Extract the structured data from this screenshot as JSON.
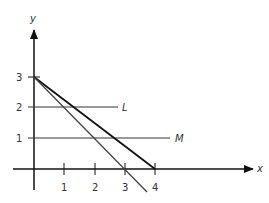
{
  "diagram": {
    "axes": {
      "x_label": "x",
      "y_label": "y",
      "x_ticks": [
        "1",
        "2",
        "3",
        "4"
      ],
      "y_ticks": [
        "1",
        "2",
        "3"
      ]
    },
    "lines": [
      {
        "name": "L",
        "type": "horizontal",
        "y": 2,
        "x_from": 0,
        "x_to": 3.2,
        "label": "L"
      },
      {
        "name": "M",
        "type": "horizontal",
        "y": 1,
        "x_from": 0,
        "x_to": 4.5,
        "label": "M"
      },
      {
        "name": "line-through-3-4",
        "from": [
          0,
          3
        ],
        "to": [
          4,
          0
        ],
        "label": ""
      },
      {
        "name": "line-through-3-3",
        "from": [
          0,
          3
        ],
        "to": [
          3.6,
          -0.6
        ],
        "label": ""
      }
    ]
  }
}
